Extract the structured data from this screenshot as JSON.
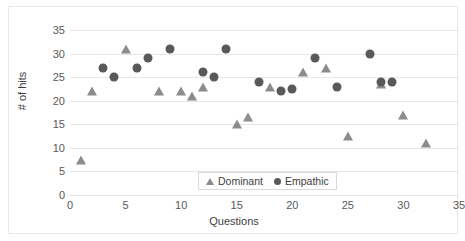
{
  "chart_data": {
    "type": "scatter",
    "title": "",
    "xlabel": "Questions",
    "ylabel": "# of hits",
    "xlim": [
      0,
      35
    ],
    "ylim": [
      0,
      35
    ],
    "xticks": [
      0,
      5,
      10,
      15,
      20,
      25,
      30,
      35
    ],
    "yticks": [
      0,
      5,
      10,
      15,
      20,
      25,
      30,
      35
    ],
    "grid": "horizontal",
    "legend_position": "bottom-center",
    "colors": {
      "dominant": "#8c8c8c",
      "empathic": "#595959",
      "gridline": "#e6e6e6",
      "text": "#595959"
    },
    "series": [
      {
        "name": "Dominant",
        "marker": "triangle",
        "color": "#8c8c8c",
        "points": [
          {
            "x": 1,
            "y": 7.5
          },
          {
            "x": 2,
            "y": 22
          },
          {
            "x": 5,
            "y": 31
          },
          {
            "x": 8,
            "y": 22
          },
          {
            "x": 10,
            "y": 22
          },
          {
            "x": 11,
            "y": 21
          },
          {
            "x": 12,
            "y": 23
          },
          {
            "x": 15,
            "y": 15
          },
          {
            "x": 16,
            "y": 16.5
          },
          {
            "x": 18,
            "y": 23
          },
          {
            "x": 21,
            "y": 26
          },
          {
            "x": 23,
            "y": 27
          },
          {
            "x": 25,
            "y": 12.5
          },
          {
            "x": 28,
            "y": 23.5
          },
          {
            "x": 30,
            "y": 17
          },
          {
            "x": 32,
            "y": 11
          }
        ]
      },
      {
        "name": "Empathic",
        "marker": "circle",
        "color": "#595959",
        "points": [
          {
            "x": 3,
            "y": 27
          },
          {
            "x": 4,
            "y": 25
          },
          {
            "x": 6,
            "y": 27
          },
          {
            "x": 7,
            "y": 29
          },
          {
            "x": 9,
            "y": 31
          },
          {
            "x": 12,
            "y": 26
          },
          {
            "x": 13,
            "y": 25
          },
          {
            "x": 14,
            "y": 31
          },
          {
            "x": 17,
            "y": 24
          },
          {
            "x": 19,
            "y": 22
          },
          {
            "x": 20,
            "y": 22.5
          },
          {
            "x": 22,
            "y": 29
          },
          {
            "x": 24,
            "y": 23
          },
          {
            "x": 27,
            "y": 30
          },
          {
            "x": 28,
            "y": 24
          },
          {
            "x": 29,
            "y": 24
          }
        ]
      }
    ]
  },
  "legend": {
    "items": [
      {
        "label": "Dominant",
        "marker": "triangle-icon"
      },
      {
        "label": "Empathic",
        "marker": "circle-icon"
      }
    ]
  }
}
